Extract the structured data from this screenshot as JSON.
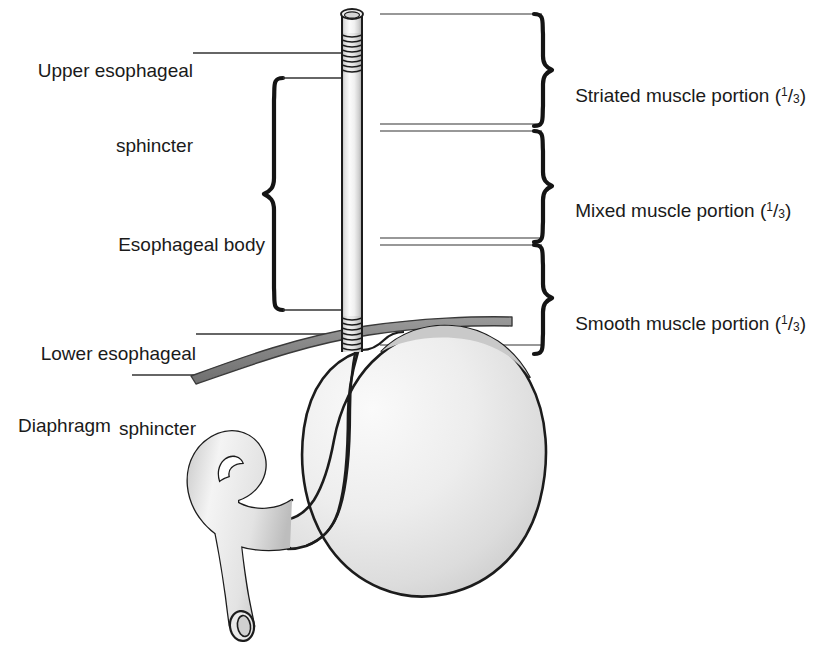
{
  "figure": {
    "background_color": "#ffffff",
    "text_color": "#1a1a1a",
    "line_color": "#222222",
    "organ_outline_color": "#1c1c1c",
    "organ_fill_light": "#f2f2f2",
    "organ_fill_mid": "#d8d8d8",
    "diaphragm_fill": "#8c8c8c"
  },
  "labels_left": [
    {
      "id": "upper-esophageal-sphincter",
      "line1": "Upper esophageal",
      "line2": "sphincter"
    },
    {
      "id": "esophageal-body",
      "line1": "Esophageal body"
    },
    {
      "id": "lower-esophageal-sphincter",
      "line1": "Lower esophageal",
      "line2": "sphincter"
    },
    {
      "id": "diaphragm",
      "line1": "Diaphragm"
    }
  ],
  "labels_right": [
    {
      "id": "striated-muscle-portion",
      "text": "Striated muscle portion (",
      "num": "1",
      "slash": "/",
      "den": "3",
      "close": ")"
    },
    {
      "id": "mixed-muscle-portion",
      "text": "Mixed muscle portion (",
      "num": "1",
      "slash": "/",
      "den": "3",
      "close": ")"
    },
    {
      "id": "smooth-muscle-portion",
      "text": "Smooth muscle portion (",
      "num": "1",
      "slash": "/",
      "den": "3",
      "close": ")"
    }
  ],
  "structures": {
    "esophagus": "esophagus-tube",
    "upper_sphincter_rings": "upper-esophageal-sphincter-rings",
    "lower_sphincter_rings": "lower-esophageal-sphincter-rings",
    "stomach": "stomach-body",
    "duodenum": "duodenum",
    "diaphragm_band": "diaphragm-band"
  }
}
